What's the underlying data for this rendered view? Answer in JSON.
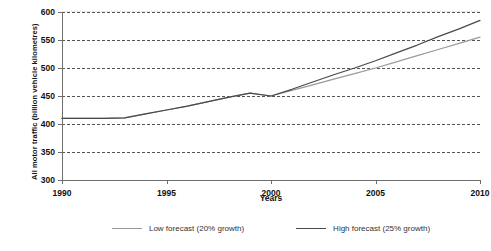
{
  "chart_data": {
    "type": "line",
    "title": "",
    "xlabel": "Years",
    "ylabel": "All motor traffic (billion vehicle kilometres)",
    "xlim": [
      1990,
      2010
    ],
    "ylim": [
      300,
      600
    ],
    "yticks": [
      300,
      350,
      400,
      450,
      500,
      550,
      600
    ],
    "xticks": [
      1990,
      1995,
      2000,
      2005,
      2010
    ],
    "grid": "horizontal-dashed",
    "legend_position": "bottom-center",
    "series": [
      {
        "name": "Low forecast (20% growth)",
        "color": "#9a9a9a",
        "x": [
          1990,
          1991,
          1992,
          1993,
          1994,
          1995,
          1996,
          1997,
          1998,
          1999,
          2000,
          2001,
          2002,
          2003,
          2004,
          2005,
          2006,
          2007,
          2008,
          2009,
          2010
        ],
        "values": [
          410,
          410,
          410,
          411,
          418,
          425,
          432,
          440,
          448,
          455,
          450,
          460,
          470,
          480,
          490,
          500,
          511,
          522,
          533,
          544,
          555
        ]
      },
      {
        "name": "High forecast (25% growth)",
        "color": "#4a4a4a",
        "x": [
          1990,
          1991,
          1992,
          1993,
          1994,
          1995,
          1996,
          1997,
          1998,
          1999,
          2000,
          2001,
          2002,
          2003,
          2004,
          2005,
          2006,
          2007,
          2008,
          2009,
          2010
        ],
        "values": [
          410,
          410,
          410,
          411,
          418,
          425,
          432,
          440,
          448,
          455,
          450,
          462,
          475,
          488,
          500,
          513,
          527,
          541,
          556,
          570,
          585
        ]
      }
    ]
  },
  "legend": {
    "items": [
      {
        "label": "Low forecast (20% growth)",
        "color": "#9a9a9a"
      },
      {
        "label": "High forecast (25% growth)",
        "color": "#4a4a4a"
      }
    ]
  },
  "axes": {
    "y_title": "All motor traffic (billion vehicle kilometres)",
    "x_title": "Years",
    "y_tick_labels": [
      "300",
      "350",
      "400",
      "450",
      "500",
      "550",
      "600"
    ],
    "x_tick_labels": [
      "1990",
      "1995",
      "2000",
      "2005",
      "2010"
    ]
  }
}
